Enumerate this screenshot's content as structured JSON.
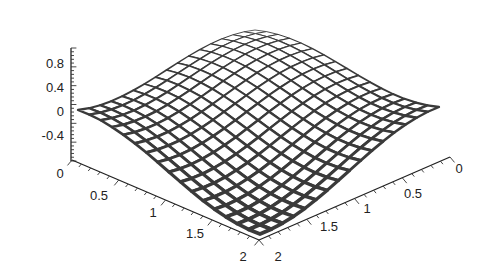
{
  "chart_data": {
    "type": "surface3d",
    "title": "",
    "function": "z = (cos(pi*x/2) + cos(pi*y/2)) / 2",
    "x_axis": {
      "label": "",
      "range": [
        0,
        2
      ],
      "ticks": [
        "0",
        "0.5",
        "1",
        "1.5",
        "2"
      ]
    },
    "y_axis": {
      "label": "",
      "range": [
        0,
        2
      ],
      "ticks": [
        "0",
        "0.5",
        "1",
        "1.5",
        "2"
      ]
    },
    "z_axis": {
      "label": "",
      "range": [
        -0.8,
        1.0
      ],
      "ticks": [
        "0.8",
        "0.4",
        "0",
        "-0.4"
      ]
    },
    "grid_resolution": 16,
    "corner_values": {
      "x0_y0": 1.0,
      "x2_y0": 0.0,
      "x0_y2": 0.0,
      "x2_y2": -0.75
    },
    "mesh_color": "#3a3a3a",
    "face_color": "#ffffff",
    "grid": false,
    "legend": null
  },
  "labels": {
    "z": [
      "0.8",
      "0.4",
      "0",
      "-0.4"
    ],
    "left": [
      "0",
      "0.5",
      "1",
      "1.5",
      "2"
    ],
    "right": [
      "0",
      "0.5",
      "1",
      "1.5",
      "2"
    ]
  }
}
